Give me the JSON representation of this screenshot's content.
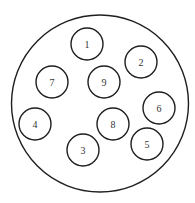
{
  "diagram": {
    "type": "circle-packing",
    "outer_circle": {
      "cx": 100,
      "cy": 103.5,
      "r": 88.5
    },
    "node_radius": 16,
    "nodes": [
      {
        "label": "1",
        "cx": 87,
        "cy": 44
      },
      {
        "label": "2",
        "cx": 141,
        "cy": 62
      },
      {
        "label": "3",
        "cx": 83,
        "cy": 150
      },
      {
        "label": "4",
        "cx": 35,
        "cy": 124
      },
      {
        "label": "5",
        "cx": 147,
        "cy": 144
      },
      {
        "label": "6",
        "cx": 159,
        "cy": 108
      },
      {
        "label": "7",
        "cx": 52,
        "cy": 82
      },
      {
        "label": "8",
        "cx": 113,
        "cy": 124
      },
      {
        "label": "9",
        "cx": 104,
        "cy": 82
      }
    ],
    "colors": {
      "stroke": "#1e1e1e",
      "label": "#333333",
      "background": "#ffffff"
    }
  }
}
